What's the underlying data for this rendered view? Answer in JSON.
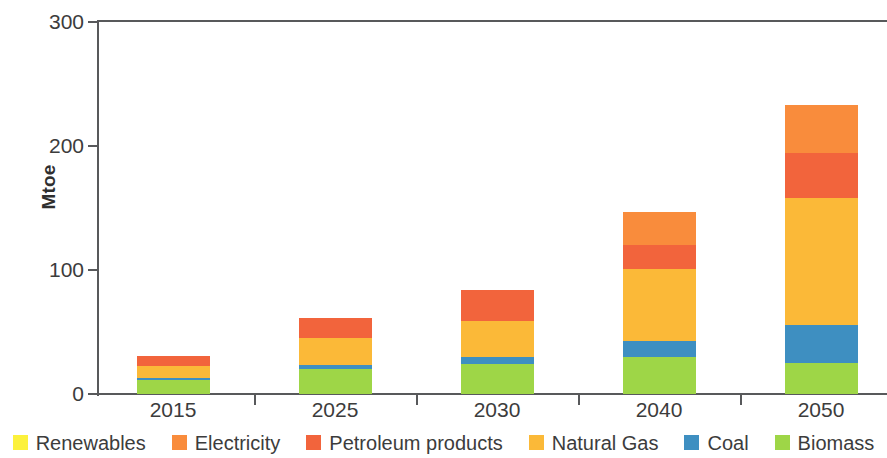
{
  "chart_data": {
    "type": "bar",
    "stacked": true,
    "title": "",
    "subtitle": "",
    "xlabel": "",
    "ylabel": "Mtoe",
    "ylim": [
      0,
      300
    ],
    "yticks": [
      0,
      100,
      200,
      300
    ],
    "ytick_labels": [
      "0",
      "100",
      "200",
      "300"
    ],
    "grid": false,
    "legend_position": "bottom",
    "categories": [
      "2015",
      "2025",
      "2030",
      "2040",
      "2050"
    ],
    "series": [
      {
        "name": "Biomass",
        "color": "#9ED647",
        "values": [
          11,
          20,
          24,
          30,
          25
        ]
      },
      {
        "name": "Coal",
        "color": "#3E8FC1",
        "values": [
          2,
          3,
          6,
          13,
          31
        ]
      },
      {
        "name": "Natural Gas",
        "color": "#FBB938",
        "values": [
          10,
          22,
          29,
          58,
          102
        ]
      },
      {
        "name": "Petroleum products",
        "color": "#F2643C",
        "values": [
          8,
          16,
          25,
          19,
          36
        ]
      },
      {
        "name": "Electricity",
        "color": "#F98C3C",
        "values": [
          0,
          0,
          0,
          27,
          39
        ]
      },
      {
        "name": "Renewables",
        "color": "#FCF13C",
        "values": [
          0,
          0,
          0,
          0,
          0
        ]
      }
    ],
    "totals": [
      31,
      61,
      84,
      147,
      233
    ]
  },
  "axes": {
    "y_title": "Mtoe",
    "y_ticks": [
      {
        "label": "300",
        "value": 300
      },
      {
        "label": "200",
        "value": 200
      },
      {
        "label": "100",
        "value": 100
      },
      {
        "label": "0",
        "value": 0
      }
    ],
    "x_ticks": [
      {
        "label": "2015"
      },
      {
        "label": "2025"
      },
      {
        "label": "2030"
      },
      {
        "label": "2040"
      },
      {
        "label": "2050"
      }
    ]
  },
  "legend": {
    "items": [
      {
        "label": "Renewables",
        "color": "#FCF13C",
        "swatch_name": "legend-swatch-renewables"
      },
      {
        "label": "Electricity",
        "color": "#F98C3C",
        "swatch_name": "legend-swatch-electricity"
      },
      {
        "label": "Petroleum products",
        "color": "#F2643C",
        "swatch_name": "legend-swatch-petroleum-products"
      },
      {
        "label": "Natural Gas",
        "color": "#FBB938",
        "swatch_name": "legend-swatch-natural-gas"
      },
      {
        "label": "Coal",
        "color": "#3E8FC1",
        "swatch_name": "legend-swatch-coal"
      },
      {
        "label": "Biomass",
        "color": "#9ED647",
        "swatch_name": "legend-swatch-biomass"
      }
    ]
  },
  "style": {
    "axis_color": "#58595b",
    "text_color": "#3c3c3c",
    "background": "#ffffff"
  }
}
